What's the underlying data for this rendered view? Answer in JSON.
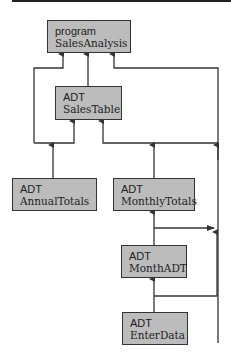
{
  "diagram": {
    "type": "module-dependency",
    "nodes": [
      {
        "id": "SalesAnalysis",
        "kind": "program",
        "name": "SalesAnalysis"
      },
      {
        "id": "SalesTable",
        "kind": "ADT",
        "name": "SalesTable"
      },
      {
        "id": "AnnualTotals",
        "kind": "ADT",
        "name": "AnnualTotals"
      },
      {
        "id": "MonthlyTotals",
        "kind": "ADT",
        "name": "MonthlyTotals"
      },
      {
        "id": "MonthADT",
        "kind": "ADT",
        "name": "MonthADT"
      },
      {
        "id": "EnterData",
        "kind": "ADT",
        "name": "EnterData"
      }
    ],
    "edges": [
      {
        "from": "SalesTable",
        "to": "SalesAnalysis"
      },
      {
        "from": "AnnualTotals",
        "to": "SalesAnalysis"
      },
      {
        "from": "AnnualTotals",
        "to": "SalesTable"
      },
      {
        "from": "MonthlyTotals",
        "to": "SalesTable"
      },
      {
        "from": "MonthlyTotals",
        "to": "SalesAnalysis"
      },
      {
        "from": "MonthADT",
        "to": "MonthlyTotals"
      },
      {
        "from": "MonthADT",
        "to": "SalesAnalysis"
      },
      {
        "from": "EnterData",
        "to": "MonthADT"
      },
      {
        "from": "EnterData",
        "to": "SalesAnalysis"
      }
    ],
    "colors": {
      "box_fill": "#bcbcbc",
      "box_border": "#333333",
      "line": "#333333"
    }
  }
}
